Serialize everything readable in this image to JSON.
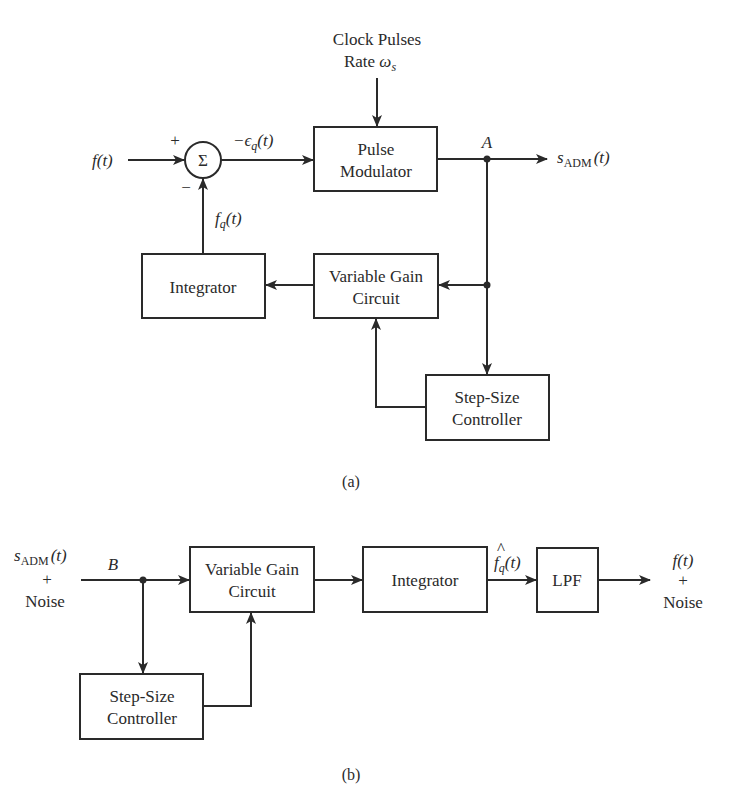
{
  "diagram_a": {
    "caption": "(a)",
    "clock": {
      "line1": "Clock Pulses",
      "line2_prefix": "Rate ",
      "line2_symbol": "ω",
      "line2_sub": "s"
    },
    "input_label": {
      "main": "f",
      "arg": "(t)"
    },
    "summer": {
      "symbol": "Σ",
      "plus": "+",
      "minus": "−"
    },
    "error_label": {
      "prefix": "−ϵ",
      "sub": "q",
      "arg": "(t)"
    },
    "feedback_label": {
      "main": "f",
      "sub": "q",
      "arg": "(t)"
    },
    "node_label": "A",
    "output_label": {
      "main": "s",
      "sub": "ADM",
      "arg": "(t)"
    },
    "blocks": {
      "pulse_modulator": {
        "line1": "Pulse",
        "line2": "Modulator"
      },
      "integrator": {
        "line1": "Integrator"
      },
      "variable_gain": {
        "line1": "Variable Gain",
        "line2": "Circuit"
      },
      "step_size": {
        "line1": "Step-Size",
        "line2": "Controller"
      }
    }
  },
  "diagram_b": {
    "caption": "(b)",
    "input_label": {
      "main": "s",
      "sub": "ADM",
      "arg": "(t)",
      "plus": "+",
      "noise": "Noise"
    },
    "node_label": "B",
    "intermediate_label": {
      "hat": "^",
      "main": "f",
      "sub": "q",
      "arg": "(t)"
    },
    "output_label": {
      "main": "f",
      "arg": "(t)",
      "plus": "+",
      "noise": "Noise"
    },
    "blocks": {
      "variable_gain": {
        "line1": "Variable Gain",
        "line2": "Circuit"
      },
      "integrator": {
        "line1": "Integrator"
      },
      "lpf": {
        "line1": "LPF"
      },
      "step_size": {
        "line1": "Step-Size",
        "line2": "Controller"
      }
    }
  }
}
